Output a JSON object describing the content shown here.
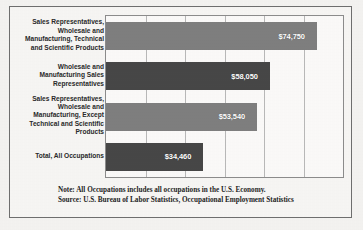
{
  "chart_data": {
    "type": "bar",
    "orientation": "horizontal",
    "title": "",
    "xlabel": "",
    "ylabel": "",
    "grid": true,
    "legend": "none",
    "xlim": [
      0,
      84000
    ],
    "categories": [
      "Sales Representatives, Wholesale and Manufacturing, Technical and Scientific Products",
      "Wholesale and Manufacturing Sales Representatives",
      "Sales Representatives, Wholesale and Manufacturing, Except Technical and Scientific Products",
      "Total, All Occupations"
    ],
    "values": [
      74750,
      58050,
      53540,
      34460
    ],
    "value_labels": [
      "$74,750",
      "$58,050",
      "$53,540",
      "$34,460"
    ],
    "bar_colors": [
      "#7f7f7f",
      "#474747",
      "#7f7f7f",
      "#474747"
    ],
    "gridline_values": [
      14000,
      28000,
      42000,
      56000,
      70000
    ]
  },
  "footnotes": {
    "note": "Note: All Occupations includes all occupations in the U.S. Economy.",
    "source": "Source: U.S. Bureau of Labor Statistics, Occupational Employment Statistics"
  },
  "colors": {
    "bar_light": "#7f7f7f",
    "bar_dark": "#474747",
    "frame": "#6f6f6f",
    "grid": "#b9b9b9",
    "page_background": "#f4f3f1",
    "plot_background": "#fbfaf9",
    "label_text": "#2a2a2a",
    "value_text": "#ffffff"
  }
}
